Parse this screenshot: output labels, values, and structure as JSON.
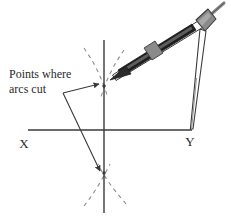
{
  "figure": {
    "background_color": "#ffffff",
    "width": 231,
    "height": 219
  },
  "labels": {
    "x_axis": "X",
    "y_axis": "Y",
    "callout_line1": "Points where",
    "callout_line2": "arcs cut"
  },
  "colors": {
    "line": "#3a3a3a",
    "dashed_arc": "#8c8c8c",
    "compass_body_dark": "#1e1e1e",
    "compass_metal_gray": "#8a8a8a",
    "compass_outline": "#3a3a3a",
    "text": "#2b2b2b"
  },
  "geometry": {
    "horizontal_axis": {
      "x1": 28,
      "y1": 130,
      "x2": 192,
      "y2": 130
    },
    "vertical_axis": {
      "x1": 104,
      "y1": 40,
      "x2": 104,
      "y2": 213
    },
    "point_x": {
      "x": 28,
      "y": 130
    },
    "point_y": {
      "x": 192,
      "y": 130
    },
    "upper_intersection": {
      "x": 104,
      "y": 86
    },
    "lower_intersection": {
      "x": 104,
      "y": 173
    },
    "callout_vertex": {
      "x": 63,
      "y": 93
    },
    "compass_hinge": {
      "x": 202,
      "y": 21
    },
    "pencil_tip": {
      "x": 110,
      "y": 80
    }
  },
  "arcs": {
    "dash_pattern": "4 4",
    "stroke_width": 1.1,
    "upper": [
      "M 84 48 C 92 60 100 72 108 98",
      "M 124 50 C 116 62 108 74 100 100"
    ],
    "lower": [
      "M 84 206 C 92 196 100 184 110 164",
      "M 126 204 C 118 194 108 184 98 164"
    ]
  },
  "callout_arrows": [
    {
      "from": {
        "x": 63,
        "y": 93
      },
      "to": {
        "x": 100,
        "y": 84
      }
    },
    {
      "from": {
        "x": 63,
        "y": 93
      },
      "to": {
        "x": 101,
        "y": 172
      }
    }
  ],
  "compass": {
    "type": "drawing-compass",
    "legs": [
      {
        "name": "pencil-leg",
        "from": {
          "x": 200,
          "y": 26
        },
        "to": {
          "x": 112,
          "y": 79
        }
      },
      {
        "name": "needle-leg",
        "from": {
          "x": 205,
          "y": 30
        },
        "to": {
          "x": 191,
          "y": 129
        }
      }
    ],
    "handle": {
      "from": {
        "x": 207,
        "y": 16
      },
      "to": {
        "x": 223,
        "y": 3
      }
    }
  }
}
